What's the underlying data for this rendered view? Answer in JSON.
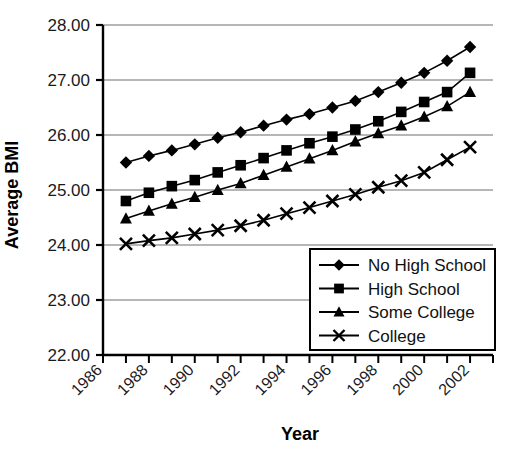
{
  "chart_data": {
    "type": "line",
    "title": "",
    "xlabel": "Year",
    "ylabel": "Average BMI",
    "xlim": [
      1986,
      2003
    ],
    "ylim": [
      22.0,
      28.0
    ],
    "grid": "horizontal",
    "legend_position": "bottom-right",
    "x": [
      1987,
      1988,
      1989,
      1990,
      1991,
      1992,
      1993,
      1994,
      1995,
      1996,
      1997,
      1998,
      1999,
      2000,
      2001,
      2002
    ],
    "xtick_labels": [
      "1986",
      "1988",
      "1990",
      "1992",
      "1994",
      "1996",
      "1998",
      "2000",
      "2002"
    ],
    "xtick_values": [
      1986,
      1988,
      1990,
      1992,
      1994,
      1996,
      1998,
      2000,
      2002
    ],
    "ytick_labels": [
      "22.00",
      "23.00",
      "24.00",
      "25.00",
      "26.00",
      "27.00",
      "28.00"
    ],
    "ytick_values": [
      22.0,
      23.0,
      24.0,
      25.0,
      26.0,
      27.0,
      28.0
    ],
    "series": [
      {
        "name": "No High School",
        "marker": "diamond",
        "values": [
          25.5,
          25.62,
          25.72,
          25.83,
          25.95,
          26.05,
          26.17,
          26.28,
          26.38,
          26.5,
          26.62,
          26.78,
          26.95,
          27.13,
          27.35,
          27.6
        ]
      },
      {
        "name": "High School",
        "marker": "square",
        "values": [
          24.8,
          24.95,
          25.07,
          25.18,
          25.32,
          25.45,
          25.58,
          25.72,
          25.85,
          25.97,
          26.1,
          26.25,
          26.42,
          26.6,
          26.78,
          27.13
        ]
      },
      {
        "name": "Some College",
        "marker": "triangle",
        "values": [
          24.48,
          24.62,
          24.75,
          24.87,
          25.0,
          25.12,
          25.27,
          25.42,
          25.57,
          25.72,
          25.88,
          26.03,
          26.17,
          26.33,
          26.52,
          26.78
        ]
      },
      {
        "name": "College",
        "marker": "cross",
        "values": [
          24.02,
          24.08,
          24.13,
          24.2,
          24.27,
          24.35,
          24.45,
          24.57,
          24.68,
          24.8,
          24.92,
          25.05,
          25.17,
          25.32,
          25.55,
          25.78
        ]
      }
    ]
  },
  "legend": {
    "items": [
      {
        "label": "No High School",
        "marker": "diamond"
      },
      {
        "label": "High School",
        "marker": "square"
      },
      {
        "label": "Some College",
        "marker": "triangle"
      },
      {
        "label": "College",
        "marker": "cross"
      }
    ]
  },
  "colors": {
    "line": "#000000",
    "marker": "#000000",
    "grid": "#6e6e6e",
    "axis": "#000000",
    "background": "#ffffff",
    "text": "#111111"
  }
}
